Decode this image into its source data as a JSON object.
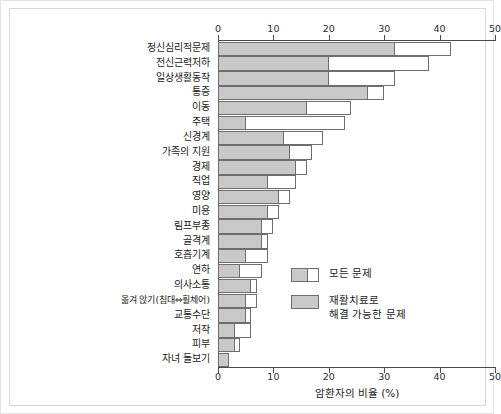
{
  "chart_data": {
    "type": "bar",
    "orientation": "horizontal",
    "stacked": true,
    "title": "",
    "xlabel": "암환자의 비율 (%)",
    "ylabel": "",
    "xlim": [
      0,
      50
    ],
    "xticks": [
      0,
      10,
      20,
      30,
      40,
      50
    ],
    "xtick_labels": [
      "0",
      "10",
      "20",
      "30",
      "40",
      "50"
    ],
    "grid": false,
    "axis_top_duplicate": true,
    "legend_position": "center-right-inside",
    "categories": [
      "정신심리적문제",
      "전신근력저하",
      "일상생활동작",
      "통증",
      "이동",
      "주택",
      "신경계",
      "가족의 지원",
      "경제",
      "직업",
      "영양",
      "미용",
      "림프부종",
      "골격계",
      "호흡기계",
      "연하",
      "의사소통",
      "옮겨 앉기(침대⇔휠체어)",
      "교통수단",
      "저작",
      "피부",
      "자녀 돌보기"
    ],
    "series": [
      {
        "name": "모든 문제",
        "key": "all_problems",
        "color": "#ffffff",
        "edge_color": "#6e6e6e",
        "values": [
          42,
          38,
          32,
          30,
          24,
          23,
          19,
          17,
          16,
          14,
          13,
          11,
          10,
          9,
          9,
          8,
          7,
          7,
          6,
          6,
          4,
          2
        ]
      },
      {
        "name": "재활치료로\n해결 가능한 문제",
        "key": "rehab_solvable",
        "color": "#c9c9c9",
        "edge_color": "#6e6e6e",
        "values": [
          32,
          20,
          20,
          27,
          16,
          5,
          12,
          13,
          14,
          9,
          11,
          9,
          8,
          8,
          5,
          4,
          6,
          5,
          5,
          3,
          3,
          2
        ]
      }
    ]
  },
  "legend": {
    "items": [
      {
        "label": "모든 문제",
        "swatch": "split-gray-white"
      },
      {
        "label": "재활치료로\n해결 가능한 문제",
        "swatch": "solid-gray"
      }
    ]
  }
}
